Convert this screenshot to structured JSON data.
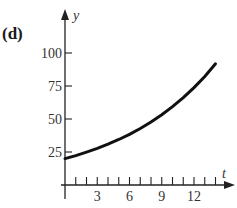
{
  "panel": {
    "label": "(d)"
  },
  "chart_data": {
    "type": "line",
    "title": "",
    "xlabel": "t",
    "ylabel": "y",
    "xlim": [
      0,
      14.5
    ],
    "ylim": [
      0,
      110
    ],
    "grid": false,
    "legend": null,
    "x_ticks_minor_step": 1,
    "x_tick_labels": [
      "3",
      "6",
      "9",
      "12"
    ],
    "y_tick_labels": [
      "25",
      "50",
      "75",
      "100"
    ],
    "series": [
      {
        "name": "curve",
        "x": [
          0,
          1,
          2,
          3,
          4,
          5,
          6,
          7,
          8,
          9,
          10,
          11,
          12,
          13,
          14
        ],
        "values": [
          20,
          22.3,
          24.9,
          27.7,
          30.9,
          34.5,
          38.4,
          42.8,
          47.7,
          53.2,
          59.3,
          66.1,
          73.8,
          82.2,
          91.8
        ]
      }
    ]
  }
}
